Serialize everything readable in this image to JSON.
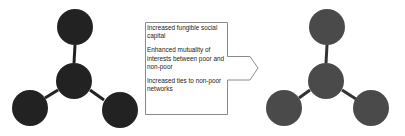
{
  "diagram": {
    "left_network": {
      "label": "before",
      "node_color": "#222222",
      "edge_color": "#222222",
      "nodes": [
        {
          "id": "top",
          "cx": 75,
          "cy": 27,
          "r": 18
        },
        {
          "id": "center",
          "cx": 74,
          "cy": 81,
          "r": 18
        },
        {
          "id": "bottom-left",
          "cx": 30,
          "cy": 108,
          "r": 18
        },
        {
          "id": "bottom-right",
          "cx": 120,
          "cy": 110,
          "r": 18
        }
      ]
    },
    "right_network": {
      "label": "after",
      "node_color": "#4a4a4a",
      "edge_color": "#333333",
      "nodes": [
        {
          "id": "top",
          "cx": 327,
          "cy": 27,
          "r": 18
        },
        {
          "id": "center",
          "cx": 326,
          "cy": 81,
          "r": 18
        },
        {
          "id": "bottom-left",
          "cx": 284,
          "cy": 108,
          "r": 18
        },
        {
          "id": "bottom-right",
          "cx": 371,
          "cy": 108,
          "r": 18
        }
      ]
    },
    "arrow_box": {
      "border_color": "#8a8a8a",
      "items": [
        "Increased fungible social capital",
        "Enhanced mutuality of interests between poor and non-poor",
        "Increased ties to non-poor networks"
      ]
    }
  }
}
